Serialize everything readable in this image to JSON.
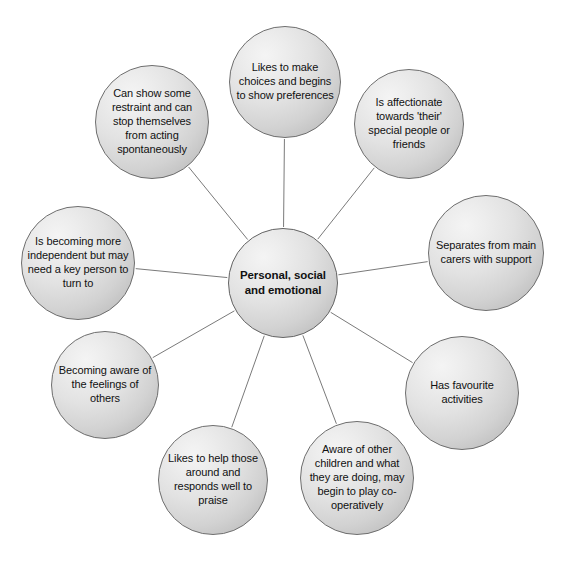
{
  "diagram": {
    "type": "radial-mind-map",
    "center": {
      "id": "center",
      "label": "Personal, social and emotional",
      "cx": 283,
      "cy": 283,
      "r": 55
    },
    "style": {
      "node_fill_light": "#f4f4f4",
      "node_fill_dark": "#b2b2b2",
      "node_border": "#6e6e6e",
      "edge_color": "#7a7a7a",
      "text_color": "#111111",
      "background": "#ffffff"
    },
    "nodes": [
      {
        "id": "choices",
        "label": "Likes to make choices and begins to show preferences",
        "cx": 285,
        "cy": 82,
        "r": 56
      },
      {
        "id": "affectionate",
        "label": "Is affectionate towards 'their' special people or friends",
        "cx": 409,
        "cy": 124,
        "r": 55
      },
      {
        "id": "separates",
        "label": "Separates from main carers with support",
        "cx": 486,
        "cy": 253,
        "r": 58
      },
      {
        "id": "favourite",
        "label": "Has favourite activities",
        "cx": 462,
        "cy": 393,
        "r": 57
      },
      {
        "id": "aware-children",
        "label": "Aware of other children and what they are doing, may begin to play co-operatively",
        "cx": 357,
        "cy": 478,
        "r": 57
      },
      {
        "id": "likes-to-help",
        "label": "Likes to help those around and responds well to praise",
        "cx": 213,
        "cy": 480,
        "r": 55
      },
      {
        "id": "feelings-others",
        "label": "Becoming aware of the feelings of others",
        "cx": 105,
        "cy": 385,
        "r": 54
      },
      {
        "id": "independent",
        "label": "Is becoming more independent but may need a key person to turn to",
        "cx": 78,
        "cy": 263,
        "r": 57
      },
      {
        "id": "restraint",
        "label": "Can show some restraint and can stop themselves from acting spontaneously",
        "cx": 152,
        "cy": 122,
        "r": 57
      }
    ]
  }
}
